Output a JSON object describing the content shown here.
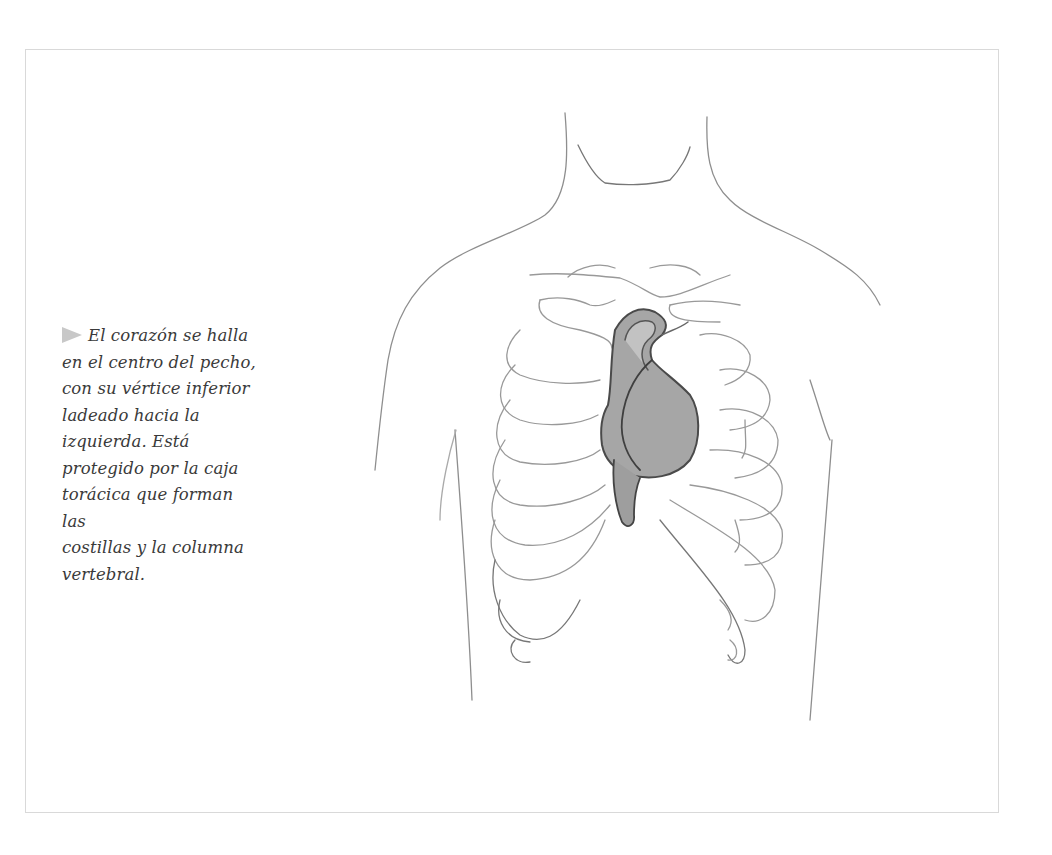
{
  "caption": {
    "bullet_icon": "triangle-right-icon",
    "lines": [
      "El corazón se halla",
      "en el centro del pecho,",
      "con su vértice inferior",
      "ladeado hacia la",
      "izquierda. Está",
      "protegido por la caja",
      "torácica que forman las",
      "costillas y la columna",
      "vertebral."
    ]
  },
  "illustration": {
    "subject": "heart-in-ribcage-sketch",
    "colors": {
      "line": "#8a8a8a",
      "heart_fill": "#9a9a9a",
      "bullet": "#c8c8c8",
      "frame_border": "#d9d9d9"
    }
  }
}
